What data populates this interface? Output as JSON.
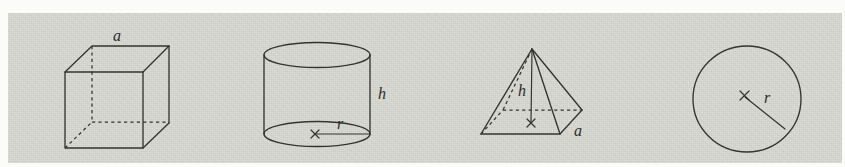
{
  "figure": {
    "panel": {
      "background_color": "#d7d8d0",
      "page_color": "#fbfbf9",
      "ink_color": "#35352f",
      "width": 834,
      "height": 150
    },
    "shapes": [
      {
        "name": "cube",
        "kind": "rectangular-solid",
        "labels": [
          {
            "id": "cube-a",
            "text": "a",
            "meaning": "edge-length",
            "x": 117,
            "y": 41
          }
        ]
      },
      {
        "name": "cylinder",
        "kind": "cylinder",
        "labels": [
          {
            "id": "cylinder-h",
            "text": "h",
            "meaning": "height",
            "x": 378,
            "y": 99
          },
          {
            "id": "cylinder-r",
            "text": "r",
            "meaning": "base-radius",
            "x": 337,
            "y": 129
          }
        ]
      },
      {
        "name": "pyramid",
        "kind": "square-pyramid",
        "labels": [
          {
            "id": "pyramid-h",
            "text": "h",
            "meaning": "height",
            "x": 518,
            "y": 96
          },
          {
            "id": "pyramid-a",
            "text": "a",
            "meaning": "base-edge-length",
            "x": 574,
            "y": 136
          }
        ]
      },
      {
        "name": "circle",
        "kind": "circle",
        "labels": [
          {
            "id": "circle-r",
            "text": "r",
            "meaning": "radius",
            "x": 764,
            "y": 103
          }
        ]
      }
    ]
  }
}
